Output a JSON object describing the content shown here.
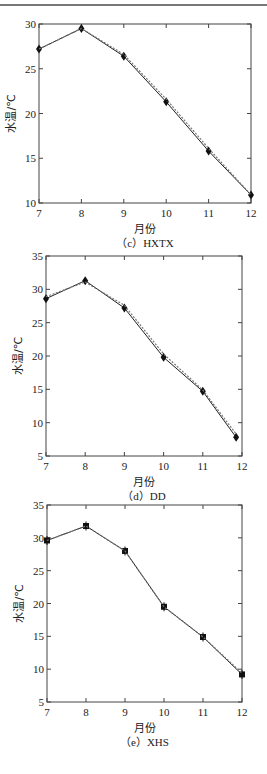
{
  "chart_data": [
    {
      "id": "c",
      "type": "line",
      "title": "",
      "caption": "（c）HXTX",
      "xlabel": "月份",
      "ylabel": "水温/℃",
      "xlim": [
        7,
        12
      ],
      "ylim": [
        10,
        30
      ],
      "xticks": [
        7,
        8,
        9,
        10,
        11,
        12
      ],
      "yticks": [
        10,
        15,
        20,
        25,
        30
      ],
      "grid": false,
      "legend": null,
      "series": [
        {
          "name": "observed",
          "style": "solid",
          "marker": "diamond",
          "x": [
            7,
            8,
            9,
            10,
            11,
            12
          ],
          "y": [
            27.2,
            29.5,
            26.4,
            21.3,
            15.8,
            10.9
          ]
        },
        {
          "name": "simulated",
          "style": "dashed",
          "marker": "none",
          "x": [
            7,
            8,
            9,
            10,
            11,
            12
          ],
          "y": [
            27.2,
            29.5,
            26.6,
            21.6,
            16.1,
            10.9
          ]
        }
      ],
      "layout": {
        "top": 24,
        "left": 39,
        "right": 251,
        "bottom": 203
      }
    },
    {
      "id": "d",
      "type": "line",
      "title": "",
      "caption": "（d）DD",
      "xlabel": "月份",
      "ylabel": "水温/℃",
      "xlim": [
        7,
        12
      ],
      "ylim": [
        5,
        35
      ],
      "xticks": [
        7,
        8,
        9,
        10,
        11,
        12
      ],
      "yticks": [
        5,
        10,
        15,
        20,
        25,
        30,
        35
      ],
      "grid": false,
      "legend": null,
      "series": [
        {
          "name": "observed",
          "style": "solid",
          "marker": "diamond",
          "x": [
            7,
            8,
            9,
            10,
            11,
            11.85
          ],
          "y": [
            28.6,
            31.3,
            27.2,
            19.8,
            14.7,
            7.8
          ]
        },
        {
          "name": "simulated",
          "style": "dashed",
          "marker": "none",
          "x": [
            7,
            8,
            9,
            10,
            11,
            11.85
          ],
          "y": [
            28.9,
            31.1,
            27.6,
            20.3,
            14.9,
            8.3
          ]
        }
      ],
      "layout": {
        "top": 256,
        "left": 46,
        "right": 242,
        "bottom": 456
      }
    },
    {
      "id": "e",
      "type": "line",
      "title": "",
      "caption": "（e）XHS",
      "xlabel": "月份",
      "ylabel": "水温/℃",
      "xlim": [
        7,
        12
      ],
      "ylim": [
        5,
        35
      ],
      "xticks": [
        7,
        8,
        9,
        10,
        11,
        12
      ],
      "yticks": [
        5,
        10,
        15,
        20,
        25,
        30,
        35
      ],
      "grid": false,
      "legend": null,
      "series": [
        {
          "name": "observed",
          "style": "solid",
          "marker": "star",
          "x": [
            7,
            8,
            9,
            10,
            11,
            12
          ],
          "y": [
            29.6,
            31.8,
            28.0,
            19.5,
            14.9,
            9.2
          ]
        },
        {
          "name": "simulated",
          "style": "dashed",
          "marker": "none",
          "x": [
            7,
            8,
            9,
            10,
            11,
            12
          ],
          "y": [
            29.6,
            31.8,
            28.0,
            19.5,
            14.9,
            9.4
          ]
        }
      ],
      "layout": {
        "top": 505,
        "left": 47,
        "right": 242,
        "bottom": 702
      }
    }
  ]
}
